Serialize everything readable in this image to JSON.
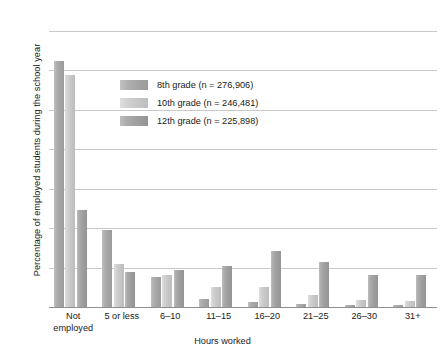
{
  "chart_data": {
    "type": "bar",
    "title": "",
    "xlabel": "Hours worked",
    "ylabel": "Percentage of employed students during the school year",
    "categories": [
      "Not employed",
      "5 or less",
      "6–10",
      "11–15",
      "16–20",
      "21–25",
      "26–30",
      "31+"
    ],
    "series": [
      {
        "name": "8th grade (n = 276,906)",
        "color": "#a8a8a8",
        "values": [
          62.5,
          19.5,
          7.5,
          2.0,
          1.3,
          0.8,
          0.5,
          0.6
        ]
      },
      {
        "name": "10th grade (n = 246,481)",
        "color": "#cfcfcf",
        "values": [
          58.8,
          11.0,
          8.0,
          5.0,
          5.0,
          3.0,
          1.7,
          1.5
        ]
      },
      {
        "name": "12th grade (n = 225,898)",
        "color": "#a2a2a2",
        "values": [
          24.5,
          9.0,
          9.5,
          10.5,
          14.2,
          11.5,
          8.0,
          8.0
        ]
      }
    ],
    "ylim": [
      0,
      70
    ],
    "yticks": [
      0,
      10,
      20,
      30,
      40,
      50,
      60,
      70
    ],
    "ytick_labels": [
      "0",
      "10",
      "20",
      "30",
      "40",
      "50",
      "60",
      "70"
    ],
    "grid": true,
    "legend_position": "upper-left-inside"
  },
  "legend": {
    "entries": [
      {
        "label": "8th grade (n = 276,906)"
      },
      {
        "label": "10th grade (n = 246,481)"
      },
      {
        "label": "12th grade (n = 225,898)"
      }
    ]
  },
  "axes": {
    "x_title": "Hours worked",
    "y_title": "Percentage of employed students during the school year"
  },
  "x_labels": [
    {
      "line1": "Not",
      "line2": "employed"
    },
    {
      "line1": "5 or less",
      "line2": ""
    },
    {
      "line1": "6–10",
      "line2": ""
    },
    {
      "line1": "11–15",
      "line2": ""
    },
    {
      "line1": "16–20",
      "line2": ""
    },
    {
      "line1": "21–25",
      "line2": ""
    },
    {
      "line1": "26–30",
      "line2": ""
    },
    {
      "line1": "31+",
      "line2": ""
    }
  ]
}
